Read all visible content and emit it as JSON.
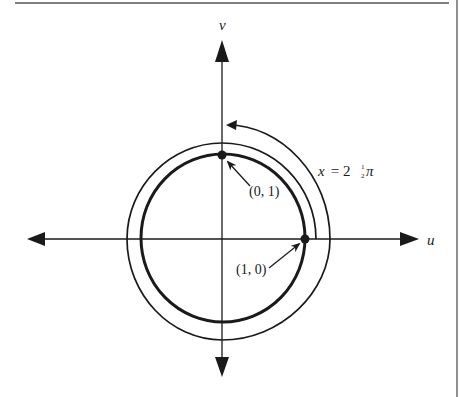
{
  "diagram": {
    "type": "unit-circle-winding",
    "axes": {
      "horizontal_label": "u",
      "vertical_label": "v"
    },
    "points": [
      {
        "label": "(0, 1)",
        "coords": [
          0,
          1
        ]
      },
      {
        "label": "(1, 0)",
        "coords": [
          1,
          0
        ]
      }
    ],
    "winding_label": {
      "var": "x",
      "eq": " = 2",
      "frac": "1/2",
      "pi": "π"
    },
    "winding_label_text": "x = 2½π",
    "colors": {
      "ink": "#1a1a1a",
      "background": "#ffffff",
      "frame": "#555555"
    }
  }
}
